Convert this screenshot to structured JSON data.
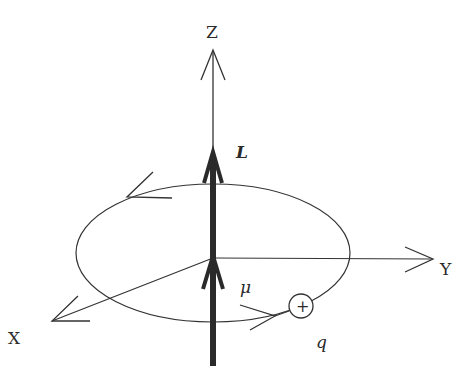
{
  "diagram": {
    "title": "",
    "labels": {
      "z_axis": "Z",
      "y_axis": "Y",
      "x_axis": "X",
      "angular_momentum": "L",
      "magnetic_moment": "μ",
      "charge": "q",
      "charge_sign": "+"
    },
    "colors": {
      "line": "#333333",
      "thick_vector": "#2a2a2a",
      "background": "#ffffff"
    }
  }
}
